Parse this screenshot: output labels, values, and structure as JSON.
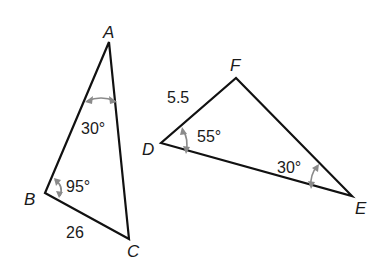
{
  "diagram": {
    "triangles": [
      {
        "name": "ABC",
        "vertices": {
          "A": {
            "label": "A",
            "x": 109,
            "y": 42
          },
          "B": {
            "label": "B",
            "x": 45,
            "y": 193
          },
          "C": {
            "label": "C",
            "x": 129,
            "y": 239
          }
        },
        "angles": {
          "A": "30°",
          "B": "95°"
        },
        "sides": {
          "BC": "26"
        }
      },
      {
        "name": "DEF",
        "vertices": {
          "D": {
            "label": "D",
            "x": 161,
            "y": 143
          },
          "E": {
            "label": "E",
            "x": 352,
            "y": 196
          },
          "F": {
            "label": "F",
            "x": 236,
            "y": 78
          }
        },
        "angles": {
          "D": "55°",
          "E": "30°"
        },
        "sides": {
          "DF": "5.5"
        }
      }
    ],
    "colors": {
      "edge": "#111111",
      "angle_marker": "#8a8a8a",
      "text": "#1a1a1a"
    }
  }
}
